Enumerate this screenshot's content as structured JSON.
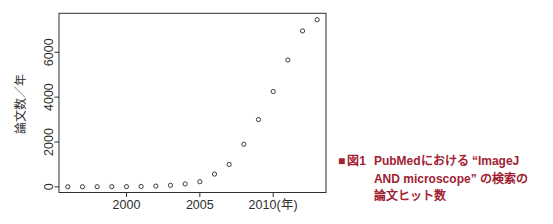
{
  "page": {
    "background": "#ffffff"
  },
  "chart_data": {
    "type": "scatter",
    "title": "",
    "xlabel": "",
    "ylabel": "論文数／年",
    "x": [
      1996,
      1997,
      1998,
      1999,
      2000,
      2001,
      2002,
      2003,
      2004,
      2005,
      2006,
      2007,
      2008,
      2009,
      2010,
      2011,
      2012,
      2013
    ],
    "values": [
      5,
      5,
      8,
      10,
      12,
      18,
      35,
      70,
      130,
      230,
      570,
      1000,
      1900,
      3000,
      4250,
      5650,
      6950,
      7450
    ],
    "x_ticks": [
      {
        "value": 2000,
        "label": "2000"
      },
      {
        "value": 2005,
        "label": "2005"
      },
      {
        "value": 2010,
        "label": "2010(年)"
      }
    ],
    "y_ticks": [
      {
        "value": 0,
        "label": "0"
      },
      {
        "value": 2000,
        "label": "2000"
      },
      {
        "value": 4000,
        "label": "4000"
      },
      {
        "value": 6000,
        "label": "6000"
      }
    ],
    "xlim": [
      1995.4,
      2013.6
    ],
    "ylim": [
      -250,
      7735
    ],
    "grid": false,
    "legend": "none",
    "marker": "open-circle",
    "axis_color": "#2f2f2f",
    "point_color": "#3a3a3a"
  },
  "caption": {
    "marker": "■",
    "fig_number": "図1",
    "lines": [
      "PubMedにおける “ImageJ",
      "AND microscope” の検索の",
      "論文ヒット数"
    ],
    "color": "#9f2232"
  }
}
